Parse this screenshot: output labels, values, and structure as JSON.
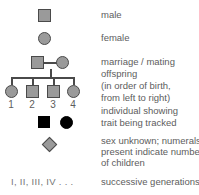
{
  "figure": {
    "colors": {
      "symbol_fill": "#9a9a9a",
      "symbol_stroke": "#4a4a4a",
      "affected_fill": "#000000",
      "text": "#5d5d5d",
      "background": "#ffffff"
    }
  },
  "rows": [
    {
      "key": "male",
      "symbol": "square-open",
      "label": "male"
    },
    {
      "key": "female",
      "symbol": "circle-open",
      "label": "female"
    },
    {
      "key": "marriage",
      "symbol": "square-line-circle",
      "label": "marriage / mating"
    },
    {
      "key": "offspring",
      "symbol": "sibship-line",
      "label_line1": "offspring",
      "label_line2": "(in order of birth,",
      "label_line3": "from left to right)"
    },
    {
      "key": "affected",
      "symbol": "filled-square-and-circle",
      "label_line1": "individual showing",
      "label_line2": "trait being tracked"
    },
    {
      "key": "unknown-sex",
      "symbol": "diamond-open",
      "label_line1": "sex unknown; numerals",
      "label_line2": "present indicate number",
      "label_line3": "of children"
    },
    {
      "key": "generations",
      "symbol": "roman-numerals",
      "numerals": "I, II, III, IV . . .",
      "label": "successive generations"
    }
  ],
  "offspring": {
    "children": [
      {
        "order": "1",
        "symbol": "circle-open"
      },
      {
        "order": "2",
        "symbol": "square-open"
      },
      {
        "order": "3",
        "symbol": "square-open"
      },
      {
        "order": "4",
        "symbol": "circle-open"
      }
    ]
  }
}
